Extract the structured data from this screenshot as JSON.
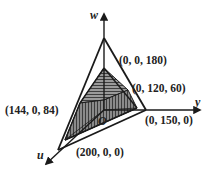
{
  "diagram": {
    "type": "3d-region-tetrahedron",
    "axes": {
      "w": {
        "label": "w"
      },
      "y": {
        "label": "y"
      },
      "u": {
        "label": "u"
      }
    },
    "origin_label": "O",
    "vertices": [
      {
        "id": "w-top",
        "label": "(0, 0, 180)"
      },
      {
        "id": "yw-point",
        "label": "(0, 120, 60)"
      },
      {
        "id": "uw-point",
        "label": "(144, 0, 84)"
      },
      {
        "id": "y-point",
        "label": "(0, 150, 0)"
      },
      {
        "id": "u-point",
        "label": "(200, 0, 0)"
      }
    ],
    "colors": {
      "line": "#1a1a1a",
      "shade": "#7a7a7a",
      "background": "#ffffff"
    }
  }
}
